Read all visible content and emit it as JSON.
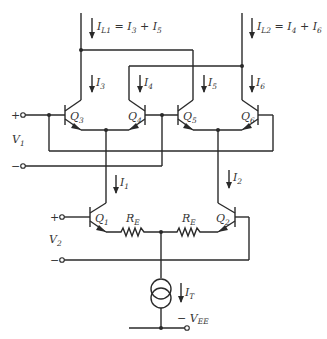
{
  "diagram": {
    "type": "circuit-schematic",
    "labels": {
      "il1": {
        "main": "I",
        "sub": "L1",
        "rest": " = I",
        "sub2": "3",
        "plus": " + I",
        "sub3": "5"
      },
      "il2": {
        "main": "I",
        "sub": "L2",
        "rest": " = I",
        "sub2": "4",
        "plus": " + I",
        "sub3": "6"
      },
      "i3": {
        "main": "I",
        "sub": "3"
      },
      "i4": {
        "main": "I",
        "sub": "4"
      },
      "i5": {
        "main": "I",
        "sub": "5"
      },
      "i6": {
        "main": "I",
        "sub": "6"
      },
      "i1": {
        "main": "I",
        "sub": "1"
      },
      "i2": {
        "main": "I",
        "sub": "2"
      },
      "it": {
        "main": "I",
        "sub": "T"
      },
      "q1": {
        "main": "Q",
        "sub": "1"
      },
      "q2": {
        "main": "Q",
        "sub": "2"
      },
      "q3": {
        "main": "Q",
        "sub": "3"
      },
      "q4": {
        "main": "Q",
        "sub": "4"
      },
      "q5": {
        "main": "Q",
        "sub": "5"
      },
      "q6": {
        "main": "Q",
        "sub": "6"
      },
      "re_left": {
        "main": "R",
        "sub": "E"
      },
      "re_right": {
        "main": "R",
        "sub": "E"
      },
      "v1": {
        "main": "V",
        "sub": "1"
      },
      "v2": {
        "main": "V",
        "sub": "2"
      },
      "vee": {
        "main": "− V",
        "sub": "EE"
      },
      "v1_plus": "+",
      "v1_minus": "−",
      "v2_plus": "+",
      "v2_minus": "−"
    }
  }
}
